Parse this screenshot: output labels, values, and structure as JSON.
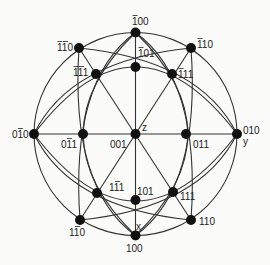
{
  "diagram": {
    "type": "stereographic-projection",
    "colors": {
      "line": "#333333",
      "pole": "#111111",
      "background": "#fbfbf9"
    },
    "axes": {
      "x": "x",
      "y": "y",
      "z": "z"
    },
    "poles": [
      {
        "id": "001",
        "digits": "001",
        "bars": []
      },
      {
        "id": "-100",
        "digits": "100",
        "bars": [
          0
        ]
      },
      {
        "id": "100",
        "digits": "100",
        "bars": []
      },
      {
        "id": "010",
        "digits": "010",
        "bars": []
      },
      {
        "id": "0-10",
        "digits": "010",
        "bars": [
          1
        ]
      },
      {
        "id": "-101",
        "digits": "101",
        "bars": [
          0
        ]
      },
      {
        "id": "101",
        "digits": "101",
        "bars": []
      },
      {
        "id": "0-11",
        "digits": "011",
        "bars": [
          1
        ]
      },
      {
        "id": "011",
        "digits": "011",
        "bars": []
      },
      {
        "id": "-1-11",
        "digits": "111",
        "bars": [
          0,
          1
        ]
      },
      {
        "id": "-111",
        "digits": "111",
        "bars": [
          0
        ]
      },
      {
        "id": "1-11",
        "digits": "111",
        "bars": [
          1
        ]
      },
      {
        "id": "111",
        "digits": "111",
        "bars": []
      },
      {
        "id": "-1-10",
        "digits": "110",
        "bars": [
          0,
          1
        ]
      },
      {
        "id": "-110",
        "digits": "110",
        "bars": [
          0
        ]
      },
      {
        "id": "1-10",
        "digits": "110",
        "bars": [
          1
        ]
      },
      {
        "id": "110",
        "digits": "110",
        "bars": []
      }
    ]
  }
}
